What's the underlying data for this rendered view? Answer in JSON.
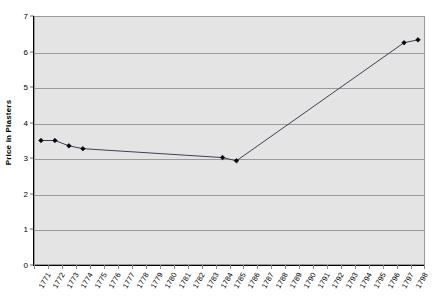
{
  "chart_data": {
    "type": "line",
    "title": "",
    "xlabel": "",
    "ylabel": "Price in Piasters",
    "ylim": [
      0,
      7
    ],
    "y_ticks": [
      0,
      1,
      2,
      3,
      4,
      5,
      6,
      7
    ],
    "grid": true,
    "legend": "none",
    "marker": "diamond",
    "line_color": "#3f3f57",
    "marker_color": "#000000",
    "plot_background": "#e4e4e4",
    "categories": [
      "1771",
      "1772",
      "1773",
      "1774",
      "1775",
      "1776",
      "1777",
      "1778",
      "1779",
      "1780",
      "1781",
      "1782",
      "1783",
      "1784",
      "1785",
      "1786",
      "1787",
      "1788",
      "1789",
      "1790",
      "1791",
      "1792",
      "1793",
      "1794",
      "1795",
      "1796",
      "1797",
      "1798"
    ],
    "series": [
      {
        "name": "Price in Piasters",
        "points": [
          {
            "x": "1771",
            "y": 3.5
          },
          {
            "x": "1772",
            "y": 3.5
          },
          {
            "x": "1773",
            "y": 3.35
          },
          {
            "x": "1774",
            "y": 3.27
          },
          {
            "x": "1784",
            "y": 3.02
          },
          {
            "x": "1785",
            "y": 2.93
          },
          {
            "x": "1797",
            "y": 6.25
          },
          {
            "x": "1798",
            "y": 6.33
          }
        ]
      }
    ]
  }
}
